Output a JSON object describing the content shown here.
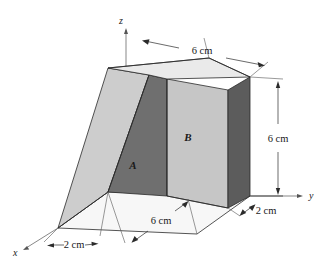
{
  "figure": {
    "axes": [
      {
        "name": "z-axis",
        "label": "z"
      },
      {
        "name": "y-axis",
        "label": "y"
      },
      {
        "name": "x-axis",
        "label": "x"
      }
    ],
    "face_labels": [
      {
        "name": "face-label-a",
        "label": "A"
      },
      {
        "name": "face-label-b",
        "label": "B"
      }
    ],
    "dimensions": [
      {
        "name": "dimension-top-width",
        "label": "6 cm",
        "position": "top"
      },
      {
        "name": "dimension-right-height",
        "label": "6 cm",
        "position": "right"
      },
      {
        "name": "dimension-base-depth",
        "label": "6 cm",
        "position": "bottom-center"
      },
      {
        "name": "dimension-base-thickness",
        "label": "2 cm",
        "position": "bottom-left"
      },
      {
        "name": "dimension-slab-thickness",
        "label": "2 cm",
        "position": "bottom-right"
      }
    ],
    "colors": {
      "background": "#ffffff",
      "top_face": "#e8e8e8",
      "front_face_b": "#c6c6c6",
      "inclined_face": "#cccccc",
      "dark_face_a": "#6b6b6b",
      "right_side_face": "#5a5a5a",
      "base_face": "#f2f2f2",
      "edge_stroke": "#2a2a2a"
    }
  }
}
